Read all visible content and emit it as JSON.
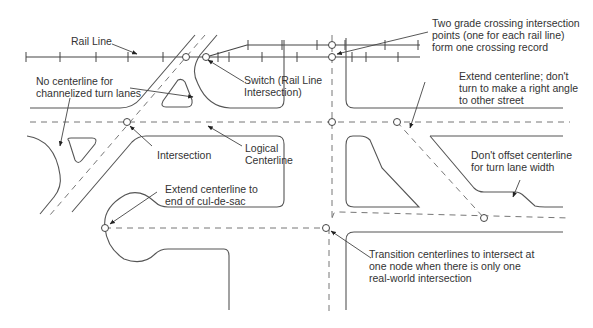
{
  "diagram": {
    "type": "road and rail centerline network annotation diagram",
    "colors": {
      "lines": "#555555",
      "centerline": "#777777",
      "text": "#333333",
      "background": "#ffffff"
    },
    "annotations": [
      {
        "id": "rail-line",
        "text": "Rail Line"
      },
      {
        "id": "no-centerline-channelized",
        "text": "No centerline for\nchannelized turn lanes"
      },
      {
        "id": "switch",
        "text": "Switch (Rail Line\nIntersection)"
      },
      {
        "id": "grade-crossing",
        "text": "Two grade crossing intersection\npoints (one for each rail line)\nform one crossing record"
      },
      {
        "id": "extend-centerline-no-right-angle",
        "text": "Extend centerline; don't\nturn to make a right angle\nto other street"
      },
      {
        "id": "intersection",
        "text": "Intersection"
      },
      {
        "id": "logical-centerline",
        "text": "Logical\nCenterline"
      },
      {
        "id": "dont-offset",
        "text": "Don't offset centerline\nfor turn lane width"
      },
      {
        "id": "cul-de-sac",
        "text": "Extend centerline to\nend of cul-de-sac"
      },
      {
        "id": "transition",
        "text": "Transition centerlines to intersect at\none node when there is only one\nreal-world intersection"
      }
    ],
    "nodes": [
      {
        "name": "rail-road-crossing-node",
        "x": 186,
        "y": 57
      },
      {
        "name": "switch-node",
        "x": 206,
        "y": 57
      },
      {
        "name": "grade-crossing-node-upper",
        "x": 332,
        "y": 45
      },
      {
        "name": "grade-crossing-node-lower",
        "x": 332,
        "y": 57
      },
      {
        "name": "intersection-node",
        "x": 127,
        "y": 122
      },
      {
        "name": "main-street-vertical-node",
        "x": 332,
        "y": 122
      },
      {
        "name": "diagonal-street-node",
        "x": 397,
        "y": 122
      },
      {
        "name": "cul-de-sac-end-node",
        "x": 105,
        "y": 228
      },
      {
        "name": "transition-node",
        "x": 326,
        "y": 228
      },
      {
        "name": "lower-diagonal-node",
        "x": 484,
        "y": 218
      }
    ]
  }
}
